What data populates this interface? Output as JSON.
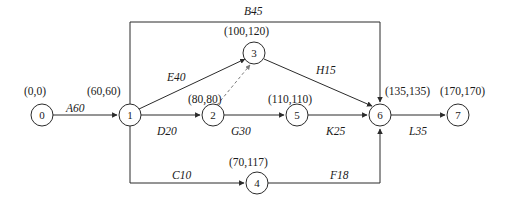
{
  "diagram": {
    "type": "activity-on-arrow network",
    "colors": {
      "line": "#2b2b2b",
      "dashed_line": "#7a7a7a",
      "text": "#1a1a1a",
      "background": "#ffffff"
    },
    "nodes": [
      {
        "id": "0",
        "label": "0",
        "cx": 42,
        "cy": 115,
        "r": 11,
        "coord": "(0,0)",
        "coord_x": 24,
        "coord_y": 86
      },
      {
        "id": "1",
        "label": "1",
        "cx": 130,
        "cy": 115,
        "r": 11,
        "coord": "(60,60)",
        "coord_x": 87,
        "coord_y": 86
      },
      {
        "id": "2",
        "label": "2",
        "cx": 213,
        "cy": 115,
        "r": 11,
        "coord": "(80,80)",
        "coord_x": 188,
        "coord_y": 94
      },
      {
        "id": "3",
        "label": "3",
        "cx": 254,
        "cy": 53,
        "r": 11,
        "coord": "(100,120)",
        "coord_x": 224,
        "coord_y": 26
      },
      {
        "id": "4",
        "label": "4",
        "cx": 257,
        "cy": 183,
        "r": 11,
        "coord": "(70,117)",
        "coord_x": 229,
        "coord_y": 157
      },
      {
        "id": "5",
        "label": "5",
        "cx": 297,
        "cy": 115,
        "r": 11,
        "coord": "(110,110)",
        "coord_x": 268,
        "coord_y": 94
      },
      {
        "id": "6",
        "label": "6",
        "cx": 380,
        "cy": 115,
        "r": 11,
        "coord": "(135,135)",
        "coord_x": 385,
        "coord_y": 86
      },
      {
        "id": "7",
        "label": "7",
        "cx": 458,
        "cy": 115,
        "r": 11,
        "coord": "(170,170)",
        "coord_x": 440,
        "coord_y": 86
      }
    ],
    "edges": [
      {
        "id": "A",
        "from": "0",
        "to": "1",
        "activity": "A",
        "duration": "60",
        "label": "A60",
        "label_x": 66,
        "label_y": 103,
        "style": "solid"
      },
      {
        "id": "B",
        "from": "1",
        "to": "6",
        "activity": "B",
        "duration": "45",
        "label": "B45",
        "label_x": 244,
        "label_y": 6,
        "style": "solid",
        "route": "top-bracket"
      },
      {
        "id": "C",
        "from": "1",
        "to": "4",
        "activity": "C",
        "duration": "10",
        "label": "C10",
        "label_x": 172,
        "label_y": 170,
        "style": "solid",
        "route": "bottom-bracket"
      },
      {
        "id": "D",
        "from": "1",
        "to": "2",
        "activity": "D",
        "duration": "20",
        "label": "D20",
        "label_x": 157,
        "label_y": 126,
        "style": "solid"
      },
      {
        "id": "E",
        "from": "1",
        "to": "3",
        "activity": "E",
        "duration": "40",
        "label": "E40",
        "label_x": 167,
        "label_y": 72,
        "style": "solid"
      },
      {
        "id": "F",
        "from": "4",
        "to": "6",
        "activity": "F",
        "duration": "18",
        "label": "F18",
        "label_x": 330,
        "label_y": 170,
        "style": "solid",
        "route": "bottom-bracket"
      },
      {
        "id": "G",
        "from": "2",
        "to": "3",
        "activity": "G",
        "duration": "30",
        "label": "G30",
        "label_x": 231,
        "label_y": 126,
        "style": "dashed"
      },
      {
        "id": "H",
        "from": "3",
        "to": "6",
        "activity": "H",
        "duration": "15",
        "label": "H15",
        "label_x": 316,
        "label_y": 65,
        "style": "solid"
      },
      {
        "id": "K",
        "from": "5",
        "to": "6",
        "activity": "K",
        "duration": "25",
        "label": "K25",
        "label_x": 326,
        "label_y": 126,
        "style": "solid"
      },
      {
        "id": "L",
        "from": "6",
        "to": "7",
        "activity": "L",
        "duration": "35",
        "label": "L35",
        "label_x": 409,
        "label_y": 126,
        "style": "solid"
      },
      {
        "id": "J",
        "from": "2",
        "to": "5",
        "activity": "",
        "duration": "",
        "label": "",
        "label_x": 0,
        "label_y": 0,
        "style": "solid"
      }
    ],
    "bracket": {
      "top_y": 22,
      "bottom_y": 183,
      "left_x": 130,
      "right_x": 380
    }
  }
}
